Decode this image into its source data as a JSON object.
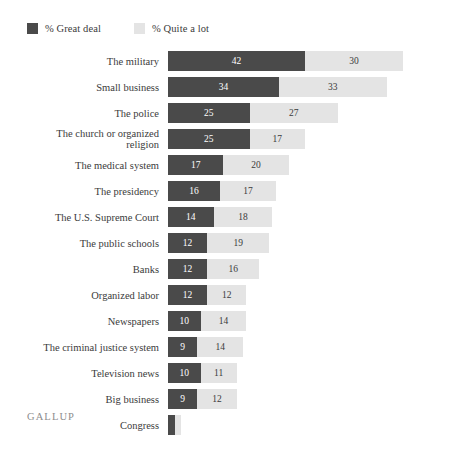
{
  "legend": {
    "entries": [
      {
        "label": "% Great deal",
        "color": "#4a4a4a",
        "swatch_name": "legend-swatch-great-deal"
      },
      {
        "label": "% Quite a lot",
        "color": "#e4e4e4",
        "swatch_name": "legend-swatch-quite-a-lot"
      }
    ]
  },
  "footer": {
    "source": "GALLUP"
  },
  "colors": {
    "great_deal": "#4a4a4a",
    "quite_a_lot": "#e4e4e4",
    "background": "#ffffff",
    "text": "#3b3b3b",
    "footer_text": "#8d8d8d"
  },
  "chart_data": {
    "type": "bar",
    "orientation": "horizontal",
    "stacked": true,
    "title": "",
    "subtitle": "",
    "xlabel": "",
    "ylabel": "",
    "xlim": [
      0,
      72
    ],
    "grid": false,
    "legend_position": "top-left",
    "value_labels": true,
    "categories": [
      "The military",
      "Small business",
      "The police",
      "The church or organized religion",
      "The medical system",
      "The presidency",
      "The U.S. Supreme Court",
      "The public schools",
      "Banks",
      "Organized labor",
      "Newspapers",
      "The criminal justice system",
      "Television news",
      "Big business",
      "Congress"
    ],
    "series": [
      {
        "name": "% Great deal",
        "color": "#4a4a4a",
        "values": [
          42,
          34,
          25,
          25,
          17,
          16,
          14,
          12,
          12,
          12,
          10,
          9,
          10,
          9,
          2
        ]
      },
      {
        "name": "% Quite a lot",
        "color": "#e4e4e4",
        "values": [
          30,
          33,
          27,
          17,
          20,
          17,
          18,
          19,
          16,
          12,
          14,
          14,
          11,
          12,
          2
        ]
      }
    ],
    "rows": [
      {
        "label_lines": [
          "The military"
        ],
        "great_deal": 42,
        "quite_a_lot": 30,
        "great_deal_label": "42",
        "quite_a_lot_label": "30"
      },
      {
        "label_lines": [
          "Small business"
        ],
        "great_deal": 34,
        "quite_a_lot": 33,
        "great_deal_label": "34",
        "quite_a_lot_label": "33"
      },
      {
        "label_lines": [
          "The police"
        ],
        "great_deal": 25,
        "quite_a_lot": 27,
        "great_deal_label": "25",
        "quite_a_lot_label": "27"
      },
      {
        "label_lines": [
          "The church or organized",
          "religion"
        ],
        "great_deal": 25,
        "quite_a_lot": 17,
        "great_deal_label": "25",
        "quite_a_lot_label": "17"
      },
      {
        "label_lines": [
          "The medical system"
        ],
        "great_deal": 17,
        "quite_a_lot": 20,
        "great_deal_label": "17",
        "quite_a_lot_label": "20"
      },
      {
        "label_lines": [
          "The presidency"
        ],
        "great_deal": 16,
        "quite_a_lot": 17,
        "great_deal_label": "16",
        "quite_a_lot_label": "17"
      },
      {
        "label_lines": [
          "The U.S. Supreme Court"
        ],
        "great_deal": 14,
        "quite_a_lot": 18,
        "great_deal_label": "14",
        "quite_a_lot_label": "18"
      },
      {
        "label_lines": [
          "The public schools"
        ],
        "great_deal": 12,
        "quite_a_lot": 19,
        "great_deal_label": "12",
        "quite_a_lot_label": "19"
      },
      {
        "label_lines": [
          "Banks"
        ],
        "great_deal": 12,
        "quite_a_lot": 16,
        "great_deal_label": "12",
        "quite_a_lot_label": "16"
      },
      {
        "label_lines": [
          "Organized labor"
        ],
        "great_deal": 12,
        "quite_a_lot": 12,
        "great_deal_label": "12",
        "quite_a_lot_label": "12"
      },
      {
        "label_lines": [
          "Newspapers"
        ],
        "great_deal": 10,
        "quite_a_lot": 14,
        "great_deal_label": "10",
        "quite_a_lot_label": "14"
      },
      {
        "label_lines": [
          "The criminal justice system"
        ],
        "great_deal": 9,
        "quite_a_lot": 14,
        "great_deal_label": "9",
        "quite_a_lot_label": "14"
      },
      {
        "label_lines": [
          "Television news"
        ],
        "great_deal": 10,
        "quite_a_lot": 11,
        "great_deal_label": "10",
        "quite_a_lot_label": "11"
      },
      {
        "label_lines": [
          "Big business"
        ],
        "great_deal": 9,
        "quite_a_lot": 12,
        "great_deal_label": "9",
        "quite_a_lot_label": "12"
      },
      {
        "label_lines": [
          "Congress"
        ],
        "great_deal": 2,
        "quite_a_lot": 2,
        "great_deal_label": "",
        "quite_a_lot_label": ""
      }
    ]
  }
}
